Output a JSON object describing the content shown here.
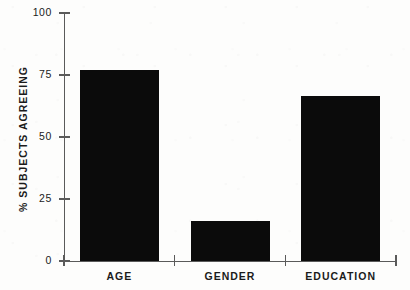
{
  "chart_data": {
    "type": "bar",
    "title": "",
    "xlabel": "",
    "ylabel": "% SUBJECTS AGREEING",
    "categories": [
      "AGE",
      "GENDER",
      "EDUCATION"
    ],
    "values": [
      77,
      16,
      66.5
    ],
    "ylim": [
      0,
      100
    ],
    "yticks": [
      0,
      25,
      50,
      75,
      100
    ],
    "ytick_labels": [
      "0",
      "25",
      "50",
      "75",
      "100"
    ],
    "grid": false,
    "legend": null,
    "bar_color": "#0b0b0b",
    "axis_color": "#5a5a5a",
    "background_color": "#fdfdfc",
    "series": [
      {
        "name": "% subjects agreeing",
        "values": [
          77,
          16,
          66.5
        ]
      }
    ]
  },
  "axes": {
    "y_title": "% SUBJECTS AGREEING",
    "ticks": [
      {
        "label": "100",
        "value": 100
      },
      {
        "label": "75",
        "value": 75
      },
      {
        "label": "50",
        "value": 50
      },
      {
        "label": "25",
        "value": 25
      },
      {
        "label": "0",
        "value": 0
      }
    ]
  },
  "bars": [
    {
      "label": "AGE",
      "value": 77
    },
    {
      "label": "GENDER",
      "value": 16
    },
    {
      "label": "EDUCATION",
      "value": 66.5
    }
  ]
}
